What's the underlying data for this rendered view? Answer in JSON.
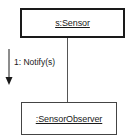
{
  "diagram": {
    "type": "UML communication diagram",
    "objects": [
      {
        "id": "sensor",
        "label": "s:Sensor",
        "border": "thick"
      },
      {
        "id": "observer",
        "label": ":SensorObserver",
        "border": "thin"
      }
    ],
    "links": [
      {
        "from": "sensor",
        "to": "observer"
      }
    ],
    "messages": [
      {
        "label": "1: Notify(s)",
        "direction": "down",
        "from": "sensor",
        "to": "observer"
      }
    ]
  },
  "colors": {
    "line": "#1a1a1a",
    "background": "#ffffff"
  }
}
